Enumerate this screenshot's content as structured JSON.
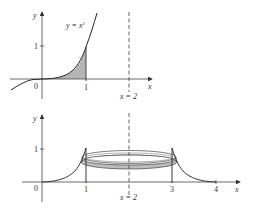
{
  "figure": {
    "top": {
      "curve_label": "y = x",
      "curve_exp": "3",
      "x_axis_label": "x",
      "y_axis_label": "y",
      "origin_label": "0",
      "x_tick_1": "1",
      "y_tick_1": "1",
      "line_label": "x = 2",
      "shaded_region": "area under y = x^3 from 0 to 1"
    },
    "bottom": {
      "x_axis_label": "x",
      "y_axis_label": "y",
      "origin_label": "0",
      "x_tick_1": "1",
      "x_tick_3": "3",
      "x_tick_4": "4",
      "y_tick_1": "1",
      "line_label": "x = 2",
      "description": "region rotated about x = 2 forming a washer-shaped ring"
    }
  }
}
